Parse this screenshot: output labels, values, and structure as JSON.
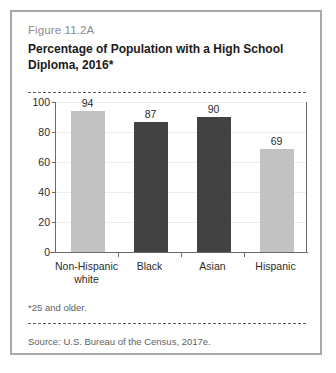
{
  "figure": {
    "number": "Figure 11.2A",
    "title": "Percentage of Population with a High School Diploma, 2016*",
    "footnote": "*25 and older.",
    "source": "Source: U.S. Bureau of the Census, 2017e."
  },
  "colors": {
    "light_bar": "#c2c2c2",
    "dark_bar": "#424242",
    "frame": "#a8a8a8",
    "axis": "#6a6a6a",
    "gridline": "#ededed",
    "title_text": "#1a1a1a",
    "muted_text": "#8a8a8a"
  },
  "chart_data": {
    "type": "bar",
    "title": "Percentage of Population with a High School Diploma, 2016*",
    "xlabel": "",
    "ylabel": "",
    "ylim": [
      0,
      100
    ],
    "yticks": [
      0,
      20,
      40,
      60,
      80,
      100
    ],
    "grid": true,
    "legend": "none",
    "categories": [
      "Non-Hispanic\nwhite",
      "Black",
      "Asian",
      "Hispanic"
    ],
    "values": [
      94,
      87,
      90,
      69
    ],
    "bar_colors": [
      "#c2c2c2",
      "#424242",
      "#424242",
      "#c2c2c2"
    ],
    "value_labels": [
      "94",
      "87",
      "90",
      "69"
    ],
    "tick_labels": [
      "0",
      "20",
      "40",
      "60",
      "80",
      "100"
    ]
  }
}
